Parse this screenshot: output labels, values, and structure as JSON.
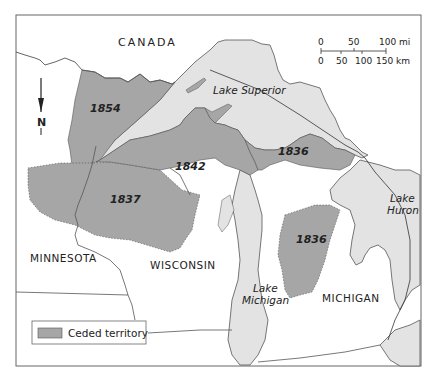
{
  "map": {
    "colors": {
      "background": "#ffffff",
      "lake": "#e3e3e3",
      "ceded": "#a6a6a6",
      "border": "#555555",
      "frame": "#666666"
    },
    "countries": [
      {
        "name": "CANADA"
      }
    ],
    "states": [
      {
        "name": "MINNESOTA"
      },
      {
        "name": "WISCONSIN"
      },
      {
        "name": "MICHIGAN"
      }
    ],
    "lakes": [
      {
        "line1": "Lake Superior"
      },
      {
        "line1": "Lake",
        "line2": "Michigan"
      },
      {
        "line1": "Lake",
        "line2": "Huron"
      }
    ],
    "ceded_territories": [
      {
        "year": "1854"
      },
      {
        "year": "1842"
      },
      {
        "year": "1837"
      },
      {
        "year": "1836"
      },
      {
        "year": "1836"
      }
    ],
    "north_arrow": {
      "label": "N"
    },
    "scale_bar": {
      "miles": {
        "ticks": [
          "0",
          "50",
          "100 mi"
        ]
      },
      "km": {
        "ticks": [
          "0",
          "50",
          "100",
          "150 km"
        ]
      }
    },
    "legend": {
      "label": "Ceded territory"
    }
  }
}
